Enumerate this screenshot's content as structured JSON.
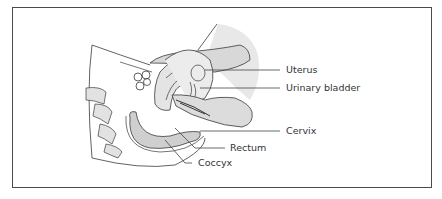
{
  "diagram": {
    "type": "anatomical-illustration",
    "colors": {
      "border": "#4a4a4a",
      "outline": "#3a3a3a",
      "fill_light": "#e6e6e6",
      "fill_mid": "#d2d2d2",
      "leader_line": "#444444",
      "text": "#333333"
    },
    "labels": [
      {
        "id": "uterus",
        "text": "Uterus"
      },
      {
        "id": "urinary-bladder",
        "text": "Urinary bladder"
      },
      {
        "id": "cervix",
        "text": "Cervix"
      },
      {
        "id": "rectum",
        "text": "Rectum"
      },
      {
        "id": "coccyx",
        "text": "Coccyx"
      }
    ]
  }
}
